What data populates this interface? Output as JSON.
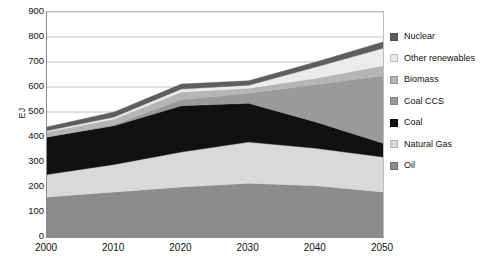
{
  "chart_data": {
    "type": "area",
    "stacked": true,
    "title": "",
    "xlabel": "",
    "ylabel": "EJ",
    "x": [
      2000,
      2010,
      2020,
      2030,
      2040,
      2050
    ],
    "xtick_labels": [
      "2000",
      "2010",
      "2020",
      "2030",
      "2040",
      "2050"
    ],
    "ytick_labels": [
      "0",
      "100",
      "200",
      "300",
      "400",
      "500",
      "600",
      "700",
      "800",
      "900"
    ],
    "yticks": [
      0,
      100,
      200,
      300,
      400,
      500,
      600,
      700,
      800,
      900
    ],
    "ylim": [
      0,
      900
    ],
    "xlim": [
      2000,
      2050
    ],
    "grid": "horizontal",
    "legend_position": "right",
    "stack_order_bottom_to_top": [
      "Oil",
      "Natural Gas",
      "Coal",
      "Coal CCS",
      "Biomass",
      "Other renewables",
      "Nuclear"
    ],
    "series": [
      {
        "name": "Oil",
        "color": "#8c8c8c",
        "values": [
          160,
          180,
          200,
          215,
          205,
          180
        ]
      },
      {
        "name": "Natural Gas",
        "color": "#d9d9d9",
        "values": [
          90,
          110,
          140,
          165,
          150,
          140
        ]
      },
      {
        "name": "Coal",
        "color": "#111111",
        "values": [
          150,
          155,
          185,
          155,
          105,
          55
        ]
      },
      {
        "name": "Coal CCS",
        "color": "#9a9a9a",
        "values": [
          0,
          5,
          25,
          40,
          150,
          270
        ]
      },
      {
        "name": "Biomass",
        "color": "#b5b5b5",
        "values": [
          20,
          22,
          30,
          20,
          25,
          40
        ]
      },
      {
        "name": "Other renewables",
        "color": "#ebebeb",
        "values": [
          5,
          8,
          12,
          12,
          45,
          70
        ]
      },
      {
        "name": "Nuclear",
        "color": "#5e5e5e",
        "values": [
          15,
          20,
          20,
          18,
          20,
          25
        ]
      }
    ],
    "totals": [
      440,
      500,
      612,
      625,
      700,
      780
    ]
  },
  "legend": {
    "items": [
      {
        "label": "Nuclear",
        "color": "#5e5e5e"
      },
      {
        "label": "Other renewables",
        "color": "#ebebeb"
      },
      {
        "label": "Biomass",
        "color": "#b5b5b5"
      },
      {
        "label": "Coal CCS",
        "color": "#9a9a9a"
      },
      {
        "label": "Coal",
        "color": "#111111"
      },
      {
        "label": "Natural Gas",
        "color": "#d9d9d9"
      },
      {
        "label": "Oil",
        "color": "#8c8c8c"
      }
    ]
  }
}
